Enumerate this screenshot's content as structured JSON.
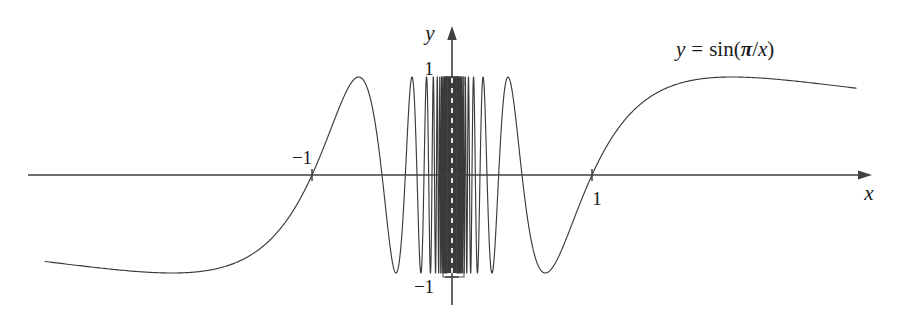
{
  "figure": {
    "title": "",
    "equation_label": {
      "lhs": "y",
      "equals": "=",
      "func": "sin(",
      "pi": "π",
      "slash": "/",
      "var": "x",
      "close": ")",
      "full": "y = sin(π/x)"
    },
    "axes": {
      "x_axis_label": "x",
      "y_axis_label": "y",
      "x_ticks": [
        {
          "label": "−1",
          "value": -1,
          "position": "above-axis"
        },
        {
          "label": "1",
          "value": 1,
          "position": "below-axis"
        }
      ],
      "y_ticks": [
        {
          "label": "1",
          "value": 1
        },
        {
          "label": "−1",
          "value": -1
        }
      ]
    },
    "colors": {
      "background": "#ffffff",
      "curve": "#3a3a3a",
      "axis": "#404040",
      "text": "#1a1a1a",
      "box": "#555555"
    }
  },
  "chart_data": {
    "type": "line",
    "title": "",
    "subtitle": "",
    "xlabel": "x",
    "ylabel": "y",
    "function": "y = sin(pi/x)",
    "xlim": [
      -2.9,
      2.9
    ],
    "ylim": [
      -1.45,
      1.45
    ],
    "grid": false,
    "legend": null,
    "annotations": [
      {
        "text": "y = sin(π/x)",
        "x": 1.9,
        "y": 1.32
      }
    ],
    "xticks": [
      -1,
      1
    ],
    "xticklabels": [
      "−1",
      "1"
    ],
    "yticks": [
      -1,
      1
    ],
    "yticklabels": [
      "−1",
      "1"
    ],
    "key_points": [
      {
        "x": -1,
        "y": 0,
        "note": "zero crossing"
      },
      {
        "x": 1,
        "y": 0,
        "note": "zero crossing"
      },
      {
        "x": -2,
        "y": -1,
        "note": "minimum"
      },
      {
        "x": 2,
        "y": 1,
        "note": "maximum"
      },
      {
        "x": 0.667,
        "y": -1,
        "note": "minimum"
      },
      {
        "x": -0.667,
        "y": 1,
        "note": "maximum"
      }
    ],
    "series": [
      {
        "name": "sin(pi/x)",
        "x_domain_left": [
          -2.9,
          -0.02
        ],
        "x_domain_right": [
          0.02,
          2.9
        ],
        "amplitude": 1,
        "oscillation_note": "infinitely many oscillations accumulating at x = 0",
        "color": "#3a3a3a"
      }
    ]
  },
  "geometry": {
    "origin_x_px": 452,
    "origin_y_px": 175,
    "unit_px": 140,
    "y_unit_px": 98,
    "x_axis_start_px": 28,
    "x_axis_end_px": 872,
    "y_axis_top_px": 26,
    "y_axis_bottom_px": 305,
    "curve_left_px": 45,
    "curve_right_px": 856,
    "dense_box": {
      "left_px": 443,
      "right_px": 464,
      "top_px": 77,
      "bottom_px": 277
    }
  }
}
